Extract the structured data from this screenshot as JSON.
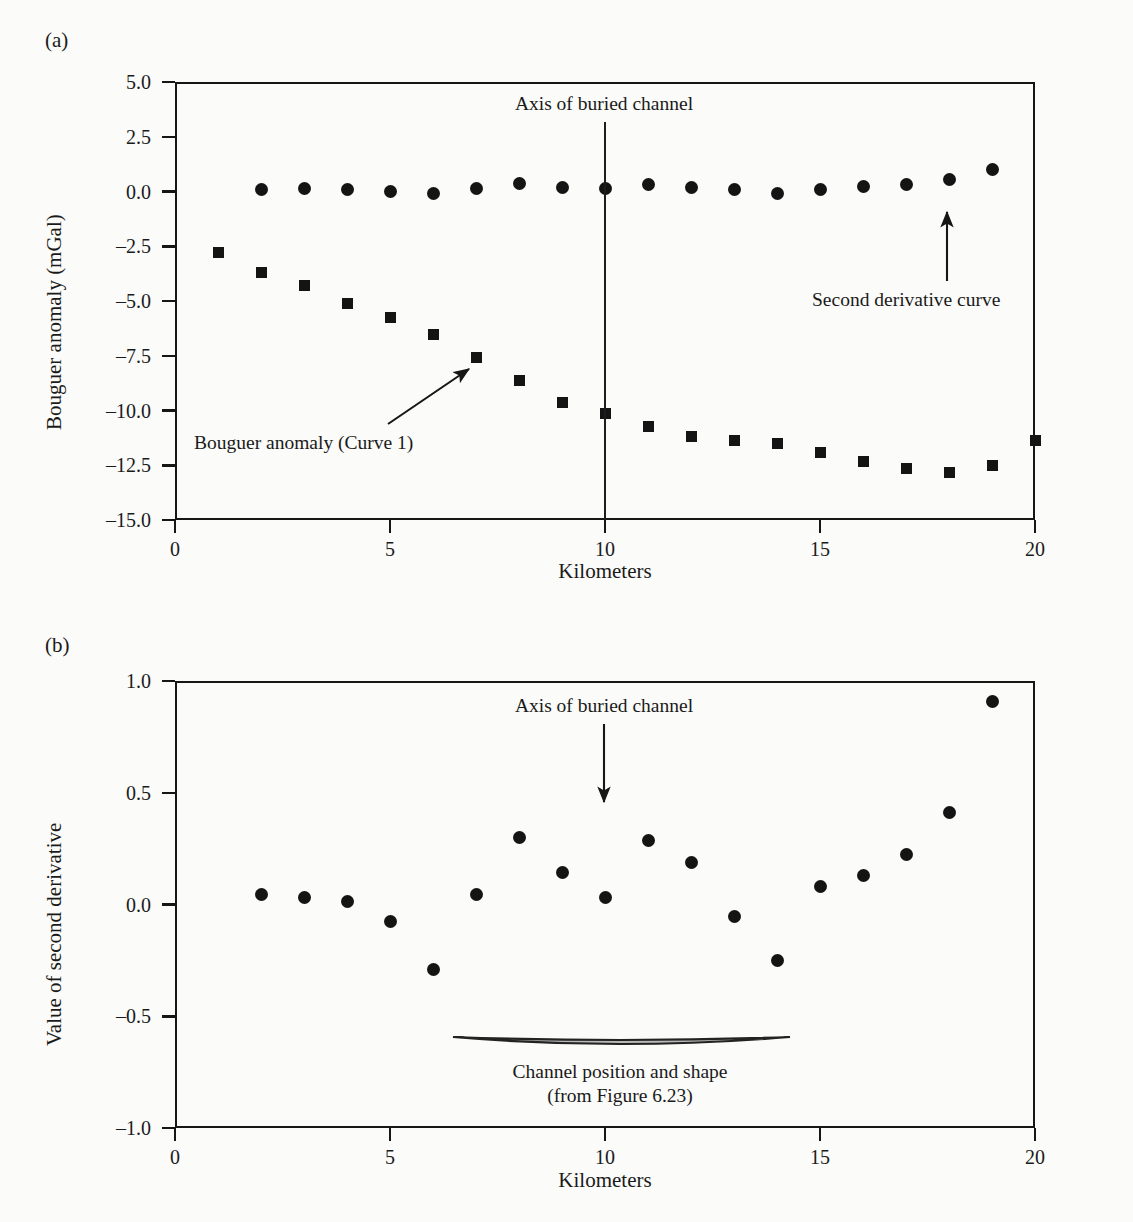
{
  "figure": {
    "panel_a_tag": "(a)",
    "panel_b_tag": "(b)"
  },
  "chart_data": [
    {
      "id": "panel-a",
      "type": "scatter",
      "title": "",
      "xlabel": "Kilometers",
      "ylabel": "Bouguer anomaly (mGal)",
      "xlim": [
        0,
        20
      ],
      "ylim": [
        -15.0,
        5.0
      ],
      "xticks": [
        0,
        5,
        10,
        15,
        20
      ],
      "xtick_labels": [
        "0",
        "5",
        "10",
        "15",
        "20"
      ],
      "yticks": [
        5.0,
        2.5,
        0.0,
        -2.5,
        -5.0,
        -7.5,
        -10.0,
        -12.5,
        -15.0
      ],
      "ytick_labels": [
        "5.0",
        "2.5",
        "0.0",
        "-2.5",
        "-5.0",
        "-7.5",
        "-10.0",
        "-12.5",
        "-15.0"
      ],
      "grid": false,
      "legend_position": "none",
      "series": [
        {
          "name": "Bouguer anomaly (Curve 1)",
          "marker": "square",
          "x": [
            1,
            2,
            3,
            4,
            5,
            6,
            7,
            8,
            9,
            10,
            11,
            12,
            13,
            14,
            15,
            16,
            17,
            18,
            19,
            20
          ],
          "values": [
            -2.8,
            -3.7,
            -4.3,
            -5.1,
            -5.75,
            -6.55,
            -7.6,
            -8.65,
            -9.65,
            -10.15,
            -10.75,
            -11.2,
            -11.35,
            -11.5,
            -11.9,
            -12.35,
            -12.65,
            -12.85,
            -12.5,
            -11.35
          ]
        },
        {
          "name": "Second derivative curve",
          "marker": "circle",
          "x": [
            2,
            3,
            4,
            5,
            6,
            7,
            8,
            9,
            10,
            11,
            12,
            13,
            14,
            15,
            16,
            17,
            18,
            19
          ],
          "values": [
            0.1,
            0.15,
            0.1,
            0.0,
            -0.1,
            0.15,
            0.35,
            0.2,
            0.15,
            0.3,
            0.2,
            0.1,
            -0.1,
            0.1,
            0.25,
            0.3,
            0.55,
            1.0
          ]
        }
      ],
      "annotations": [
        {
          "text": "Axis of buried channel",
          "x": 10.0,
          "y": 4.0,
          "kind": "vline-label"
        },
        {
          "text": "Second derivative curve",
          "x": 18.0,
          "y": -2.6,
          "kind": "arrow-label"
        },
        {
          "text": "Bouguer anomaly (Curve 1)",
          "x": 5.5,
          "y": -10.8,
          "kind": "arrow-label"
        }
      ]
    },
    {
      "id": "panel-b",
      "type": "scatter",
      "title": "",
      "xlabel": "Kilometers",
      "ylabel": "Value of second derivative",
      "xlim": [
        0,
        20
      ],
      "ylim": [
        -1.0,
        1.0
      ],
      "xticks": [
        0,
        5,
        10,
        15,
        20
      ],
      "xtick_labels": [
        "0",
        "5",
        "10",
        "15",
        "20"
      ],
      "yticks": [
        1.0,
        0.5,
        0.0,
        -0.5,
        -1.0
      ],
      "ytick_labels": [
        "1.0",
        "0.5",
        "0.0",
        "-0.5",
        "-1.0"
      ],
      "grid": false,
      "legend_position": "none",
      "series": [
        {
          "name": "Value of second derivative",
          "marker": "circle",
          "x": [
            2,
            3,
            4,
            5,
            6,
            7,
            8,
            9,
            10,
            11,
            12,
            13,
            14,
            15,
            16,
            17,
            18,
            19
          ],
          "values": [
            0.045,
            0.03,
            0.015,
            -0.075,
            -0.29,
            0.045,
            0.3,
            0.145,
            0.03,
            0.285,
            0.19,
            -0.055,
            -0.25,
            0.08,
            0.13,
            0.225,
            0.41,
            0.91
          ]
        }
      ],
      "annotations": [
        {
          "text": "Axis of buried channel",
          "x": 10.0,
          "y": 0.88,
          "kind": "arrow-label"
        },
        {
          "text": "Channel position and shape",
          "x": 10.0,
          "y": -0.72,
          "kind": "shape-label-line1"
        },
        {
          "text": "(from Figure 6.23)",
          "x": 10.0,
          "y": -0.81,
          "kind": "shape-label-line2"
        }
      ],
      "channel_shape": {
        "x_start": 6.0,
        "x_end": 14.3,
        "y_top": -0.57,
        "depth": 0.055
      }
    }
  ]
}
